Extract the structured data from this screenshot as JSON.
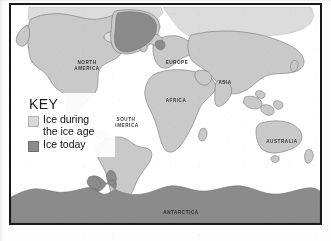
{
  "figure": {
    "type": "world-map",
    "projection": "cylindrical",
    "frame_color": "#1a1a1a",
    "background_color": "#ffffff"
  },
  "key": {
    "title": "KEY",
    "items": [
      {
        "label": "Ice during\nthe ice age",
        "swatch_color": "#d9d9d9",
        "meaning": "ice-age-extent"
      },
      {
        "label": "Ice today",
        "swatch_color": "#8b8b8b",
        "meaning": "present-day-ice"
      }
    ]
  },
  "labels": {
    "north_america": "NORTH\nAMERICA",
    "south_america": "SOUTH\nAMERICA",
    "europe": "EUROPE",
    "africa": "AFRICA",
    "asia": "ASIA",
    "australia": "AUSTRALIA",
    "antarctica": "ANTARCTICA"
  },
  "colors": {
    "land": "#c9c9c9",
    "land_outline": "#6a6a6a",
    "ice_age": "#d9d9d9",
    "ice_today": "#8b8b8b",
    "ocean": "#ffffff",
    "label_text": "#2a2a2a"
  }
}
